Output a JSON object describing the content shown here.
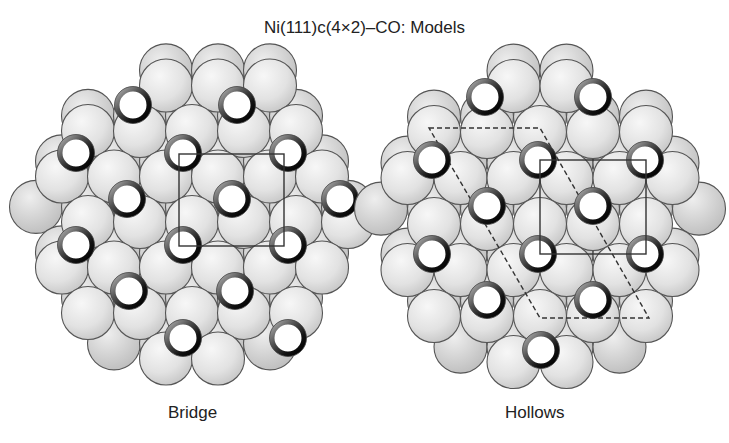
{
  "title": "Ni(111)c(4×2)–CO: Models",
  "colors": {
    "atom_fill_light": "#f4f4f4",
    "atom_fill_dark": "#c8c8c8",
    "atom_stroke": "#555555",
    "co_ring": "#222222",
    "co_ring_highlight": "#9a9a9a",
    "co_fill": "#ffffff",
    "cell_line": "#333333"
  },
  "panels": [
    {
      "id": "bridge",
      "label": "Bridge",
      "center": [
        197,
        215
      ],
      "cluster_radius": 166,
      "lattice": {
        "a": 52,
        "row_height": 45.5,
        "origin": [
          192,
          131
        ],
        "atom_r": 26.5
      },
      "co_sites": [
        [
          133,
          105
        ],
        [
          237,
          105
        ],
        [
          76,
          153
        ],
        [
          183,
          153
        ],
        [
          288,
          153
        ],
        [
          127,
          199
        ],
        [
          232,
          199
        ],
        [
          340,
          199
        ],
        [
          76,
          245
        ],
        [
          183,
          245
        ],
        [
          288,
          245
        ],
        [
          129,
          291
        ],
        [
          235,
          291
        ],
        [
          183,
          338
        ],
        [
          288,
          338
        ]
      ],
      "unit_cell_rect": {
        "x1": 179,
        "y1": 154,
        "x2": 284,
        "y2": 246
      },
      "dashed_cell": null
    },
    {
      "id": "hollows",
      "label": "Hollows",
      "center": [
        540,
        215
      ],
      "cluster_radius": 166,
      "lattice": {
        "a": 53,
        "row_height": 46,
        "origin": [
          540,
          132
        ],
        "atom_r": 26.5
      },
      "co_sites": [
        [
          485,
          97
        ],
        [
          593,
          97
        ],
        [
          432,
          160
        ],
        [
          538,
          160
        ],
        [
          645,
          160
        ],
        [
          487,
          206
        ],
        [
          593,
          206
        ],
        [
          432,
          254
        ],
        [
          538,
          254
        ],
        [
          645,
          254
        ],
        [
          487,
          300
        ],
        [
          593,
          300
        ],
        [
          541,
          350
        ]
      ],
      "unit_cell_rect": {
        "x1": 540,
        "y1": 160,
        "x2": 646,
        "y2": 254
      },
      "dashed_cell": {
        "points": [
          [
            429,
            128
          ],
          [
            540,
            128
          ],
          [
            649,
            318
          ],
          [
            540,
            318
          ]
        ]
      }
    }
  ]
}
